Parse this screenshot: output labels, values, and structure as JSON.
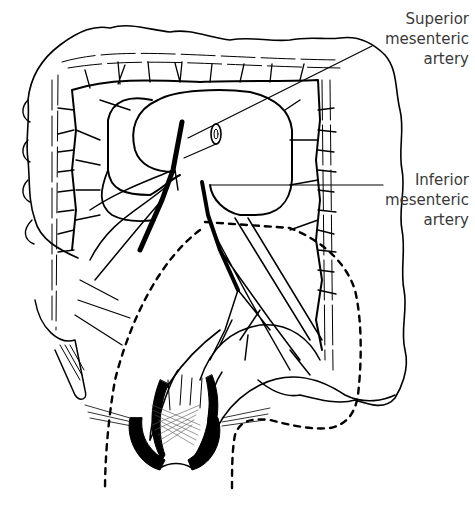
{
  "figure": {
    "stroke_color": "#000000",
    "label_color": "#3a3a3a",
    "background": "#ffffff"
  },
  "labels": [
    {
      "id": "superior-mesenteric-artery",
      "lines": [
        "Superior",
        "mesenteric",
        "artery"
      ]
    },
    {
      "id": "inferior-mesenteric-artery",
      "lines": [
        "Inferior",
        "mesenteric",
        "artery"
      ]
    }
  ]
}
